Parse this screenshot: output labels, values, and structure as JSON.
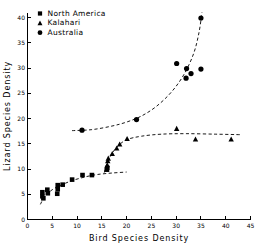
{
  "chart_data": {
    "type": "scatter",
    "title": "",
    "xlabel": "Bird Species Density",
    "ylabel": "Lizard Species Density",
    "xlim": [
      0,
      45
    ],
    "ylim": [
      0,
      41
    ],
    "xticks": [
      0,
      5,
      10,
      15,
      20,
      25,
      30,
      35,
      40,
      45
    ],
    "xticklabels": [
      "0",
      "5",
      "10",
      "15",
      "20",
      "25",
      "30",
      "35",
      "40",
      "45"
    ],
    "yticks": [
      0,
      5,
      10,
      15,
      20,
      25,
      30,
      35,
      40
    ],
    "yticklabels": [
      "0",
      "5",
      "10",
      "15",
      "20",
      "25",
      "30",
      "35",
      "40"
    ],
    "grid": false,
    "legend_position": "top-left",
    "series": [
      {
        "name": "North America",
        "marker": "square",
        "color": "#000000",
        "points": [
          {
            "x": 3.0,
            "y": 4.6
          },
          {
            "x": 3.0,
            "y": 5.4
          },
          {
            "x": 3.2,
            "y": 4.2
          },
          {
            "x": 4.0,
            "y": 5.9
          },
          {
            "x": 4.1,
            "y": 5.2
          },
          {
            "x": 6.0,
            "y": 5.1
          },
          {
            "x": 6.1,
            "y": 6.0
          },
          {
            "x": 6.1,
            "y": 6.8
          },
          {
            "x": 7.1,
            "y": 6.9
          },
          {
            "x": 9.0,
            "y": 7.9
          },
          {
            "x": 11.1,
            "y": 8.8
          },
          {
            "x": 13.0,
            "y": 8.8
          },
          {
            "x": 16.0,
            "y": 9.9
          },
          {
            "x": 16.1,
            "y": 10.2
          }
        ],
        "fit_curve": [
          {
            "x": 2.6,
            "y": 3.0
          },
          {
            "x": 3.5,
            "y": 4.6
          },
          {
            "x": 5.0,
            "y": 5.9
          },
          {
            "x": 7.0,
            "y": 6.9
          },
          {
            "x": 9.0,
            "y": 7.7
          },
          {
            "x": 11.5,
            "y": 8.4
          },
          {
            "x": 14.0,
            "y": 8.9
          },
          {
            "x": 17.0,
            "y": 9.2
          },
          {
            "x": 20.0,
            "y": 9.4
          }
        ]
      },
      {
        "name": "Kalahari",
        "marker": "triangle",
        "color": "#000000",
        "points": [
          {
            "x": 16.0,
            "y": 9.9
          },
          {
            "x": 16.1,
            "y": 10.8
          },
          {
            "x": 16.2,
            "y": 11.6
          },
          {
            "x": 16.3,
            "y": 12.1
          },
          {
            "x": 17.1,
            "y": 13.0
          },
          {
            "x": 18.0,
            "y": 14.1
          },
          {
            "x": 18.6,
            "y": 14.9
          },
          {
            "x": 20.1,
            "y": 16.0
          },
          {
            "x": 30.1,
            "y": 18.0
          },
          {
            "x": 33.9,
            "y": 15.9
          },
          {
            "x": 41.1,
            "y": 15.9
          }
        ],
        "fit_curve": [
          {
            "x": 15.5,
            "y": 9.3
          },
          {
            "x": 16.2,
            "y": 11.4
          },
          {
            "x": 17.0,
            "y": 13.0
          },
          {
            "x": 18.2,
            "y": 14.5
          },
          {
            "x": 20.0,
            "y": 15.8
          },
          {
            "x": 23.0,
            "y": 16.5
          },
          {
            "x": 27.0,
            "y": 16.9
          },
          {
            "x": 32.0,
            "y": 17.0
          },
          {
            "x": 38.0,
            "y": 16.9
          },
          {
            "x": 43.0,
            "y": 16.8
          }
        ]
      },
      {
        "name": "Australia",
        "marker": "circle",
        "color": "#000000",
        "points": [
          {
            "x": 11.0,
            "y": 17.7
          },
          {
            "x": 22.0,
            "y": 19.8
          },
          {
            "x": 30.1,
            "y": 30.9
          },
          {
            "x": 32.0,
            "y": 28.0
          },
          {
            "x": 32.1,
            "y": 29.9
          },
          {
            "x": 33.0,
            "y": 28.9
          },
          {
            "x": 35.0,
            "y": 29.8
          },
          {
            "x": 35.0,
            "y": 39.9
          }
        ],
        "fit_curve": [
          {
            "x": 9.0,
            "y": 17.6
          },
          {
            "x": 13.0,
            "y": 17.8
          },
          {
            "x": 17.0,
            "y": 18.5
          },
          {
            "x": 20.0,
            "y": 19.3
          },
          {
            "x": 23.0,
            "y": 20.5
          },
          {
            "x": 26.0,
            "y": 22.4
          },
          {
            "x": 29.0,
            "y": 25.2
          },
          {
            "x": 31.5,
            "y": 28.6
          },
          {
            "x": 33.5,
            "y": 32.8
          },
          {
            "x": 34.6,
            "y": 37.0
          },
          {
            "x": 35.2,
            "y": 41.0
          }
        ]
      }
    ],
    "legend": [
      {
        "label": "North America",
        "marker": "square"
      },
      {
        "label": "Kalahari",
        "marker": "triangle"
      },
      {
        "label": "Australia",
        "marker": "circle"
      }
    ]
  }
}
